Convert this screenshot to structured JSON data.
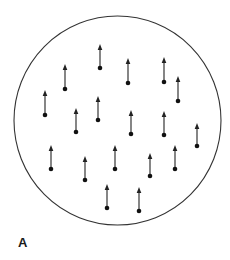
{
  "figure": {
    "panel_label": "A",
    "colors": {
      "background": "#ffffff",
      "outline": "#333333",
      "arrow": "#222222",
      "dot": "#111111",
      "label": "#1a1a1a"
    }
  },
  "boundary": {
    "shape": "circle",
    "cx": 117.5,
    "cy": 120.5,
    "rx": 103.5,
    "ry": 104.5
  },
  "dipoles": [
    {
      "x": 100,
      "base_y": 68,
      "tip_y": 44,
      "direction": "up"
    },
    {
      "x": 128,
      "base_y": 83,
      "tip_y": 58,
      "direction": "up"
    },
    {
      "x": 164,
      "base_y": 82,
      "tip_y": 57,
      "direction": "up"
    },
    {
      "x": 65,
      "base_y": 89,
      "tip_y": 64,
      "direction": "up"
    },
    {
      "x": 178,
      "base_y": 101,
      "tip_y": 76,
      "direction": "up"
    },
    {
      "x": 45,
      "base_y": 115,
      "tip_y": 90,
      "direction": "up"
    },
    {
      "x": 98,
      "base_y": 120,
      "tip_y": 96,
      "direction": "up"
    },
    {
      "x": 76,
      "base_y": 132,
      "tip_y": 108,
      "direction": "up"
    },
    {
      "x": 131,
      "base_y": 134,
      "tip_y": 110,
      "direction": "up"
    },
    {
      "x": 164,
      "base_y": 135,
      "tip_y": 111,
      "direction": "up"
    },
    {
      "x": 197,
      "base_y": 146,
      "tip_y": 123,
      "direction": "up"
    },
    {
      "x": 51,
      "base_y": 169,
      "tip_y": 145,
      "direction": "up"
    },
    {
      "x": 85,
      "base_y": 180,
      "tip_y": 156,
      "direction": "up"
    },
    {
      "x": 115,
      "base_y": 169,
      "tip_y": 145,
      "direction": "up"
    },
    {
      "x": 150,
      "base_y": 176,
      "tip_y": 153,
      "direction": "up"
    },
    {
      "x": 175,
      "base_y": 169,
      "tip_y": 145,
      "direction": "up"
    },
    {
      "x": 107,
      "base_y": 208,
      "tip_y": 184,
      "direction": "up"
    },
    {
      "x": 139,
      "base_y": 211,
      "tip_y": 187,
      "direction": "up"
    }
  ]
}
